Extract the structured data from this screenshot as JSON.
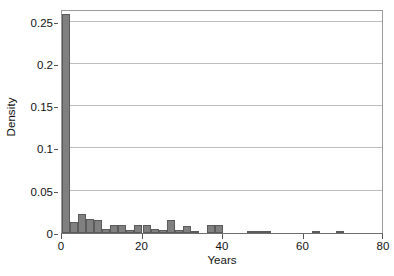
{
  "chart_data": {
    "type": "bar",
    "title": "",
    "subtitle": "",
    "xlabel": "Years",
    "ylabel": "Density",
    "xlim": [
      0,
      80
    ],
    "ylim": [
      0,
      0.265
    ],
    "xticks": [
      0,
      20,
      40,
      60,
      80
    ],
    "xtick_labels": [
      "0",
      "20",
      "40",
      "60",
      "80"
    ],
    "yticks": [
      0,
      0.05,
      0.1,
      0.15,
      0.2,
      0.25
    ],
    "ytick_labels": [
      "0",
      "0.05",
      "0.1",
      "0.15",
      "0.2",
      "0.25"
    ],
    "grid": "horizontal",
    "legend": "none",
    "bin_width": 2,
    "bar_color": "#808080",
    "bar_edge_color": "#5b5b5b",
    "grid_color": "#bdbdbd",
    "frame_color": "#9a9a9a",
    "bin_starts": [
      0,
      2,
      4,
      6,
      8,
      10,
      12,
      14,
      16,
      18,
      20,
      22,
      24,
      26,
      28,
      30,
      32,
      34,
      36,
      38,
      40,
      42,
      44,
      46,
      48,
      50,
      52,
      54,
      56,
      58,
      60,
      62,
      64,
      66,
      68
    ],
    "bin_labels": [
      "0-2",
      "2-4",
      "4-6",
      "6-8",
      "8-10",
      "10-12",
      "12-14",
      "14-16",
      "16-18",
      "18-20",
      "20-22",
      "22-24",
      "24-26",
      "26-28",
      "28-30",
      "30-32",
      "32-34",
      "34-36",
      "36-38",
      "38-40",
      "40-42",
      "42-44",
      "44-46",
      "46-48",
      "48-50",
      "50-52",
      "52-54",
      "54-56",
      "56-58",
      "58-60",
      "60-62",
      "62-64",
      "64-66",
      "66-68",
      "68-70"
    ],
    "values": [
      0.259,
      0.013,
      0.023,
      0.016,
      0.015,
      0.005,
      0.01,
      0.01,
      0.004,
      0.009,
      0.009,
      0.005,
      0.003,
      0.015,
      0.004,
      0.008,
      0.001,
      0.0,
      0.01,
      0.01,
      0.0,
      0.0,
      0.0,
      0.001,
      0.001,
      0.001,
      0.0,
      0.0,
      0.0,
      0.0,
      0.0,
      0.001,
      0.0,
      0.0,
      0.001
    ],
    "max_value": 0.259,
    "peak_bin": "0-2",
    "n_bins": 35
  },
  "axes": {
    "y_title": "Density",
    "x_title": "Years"
  }
}
